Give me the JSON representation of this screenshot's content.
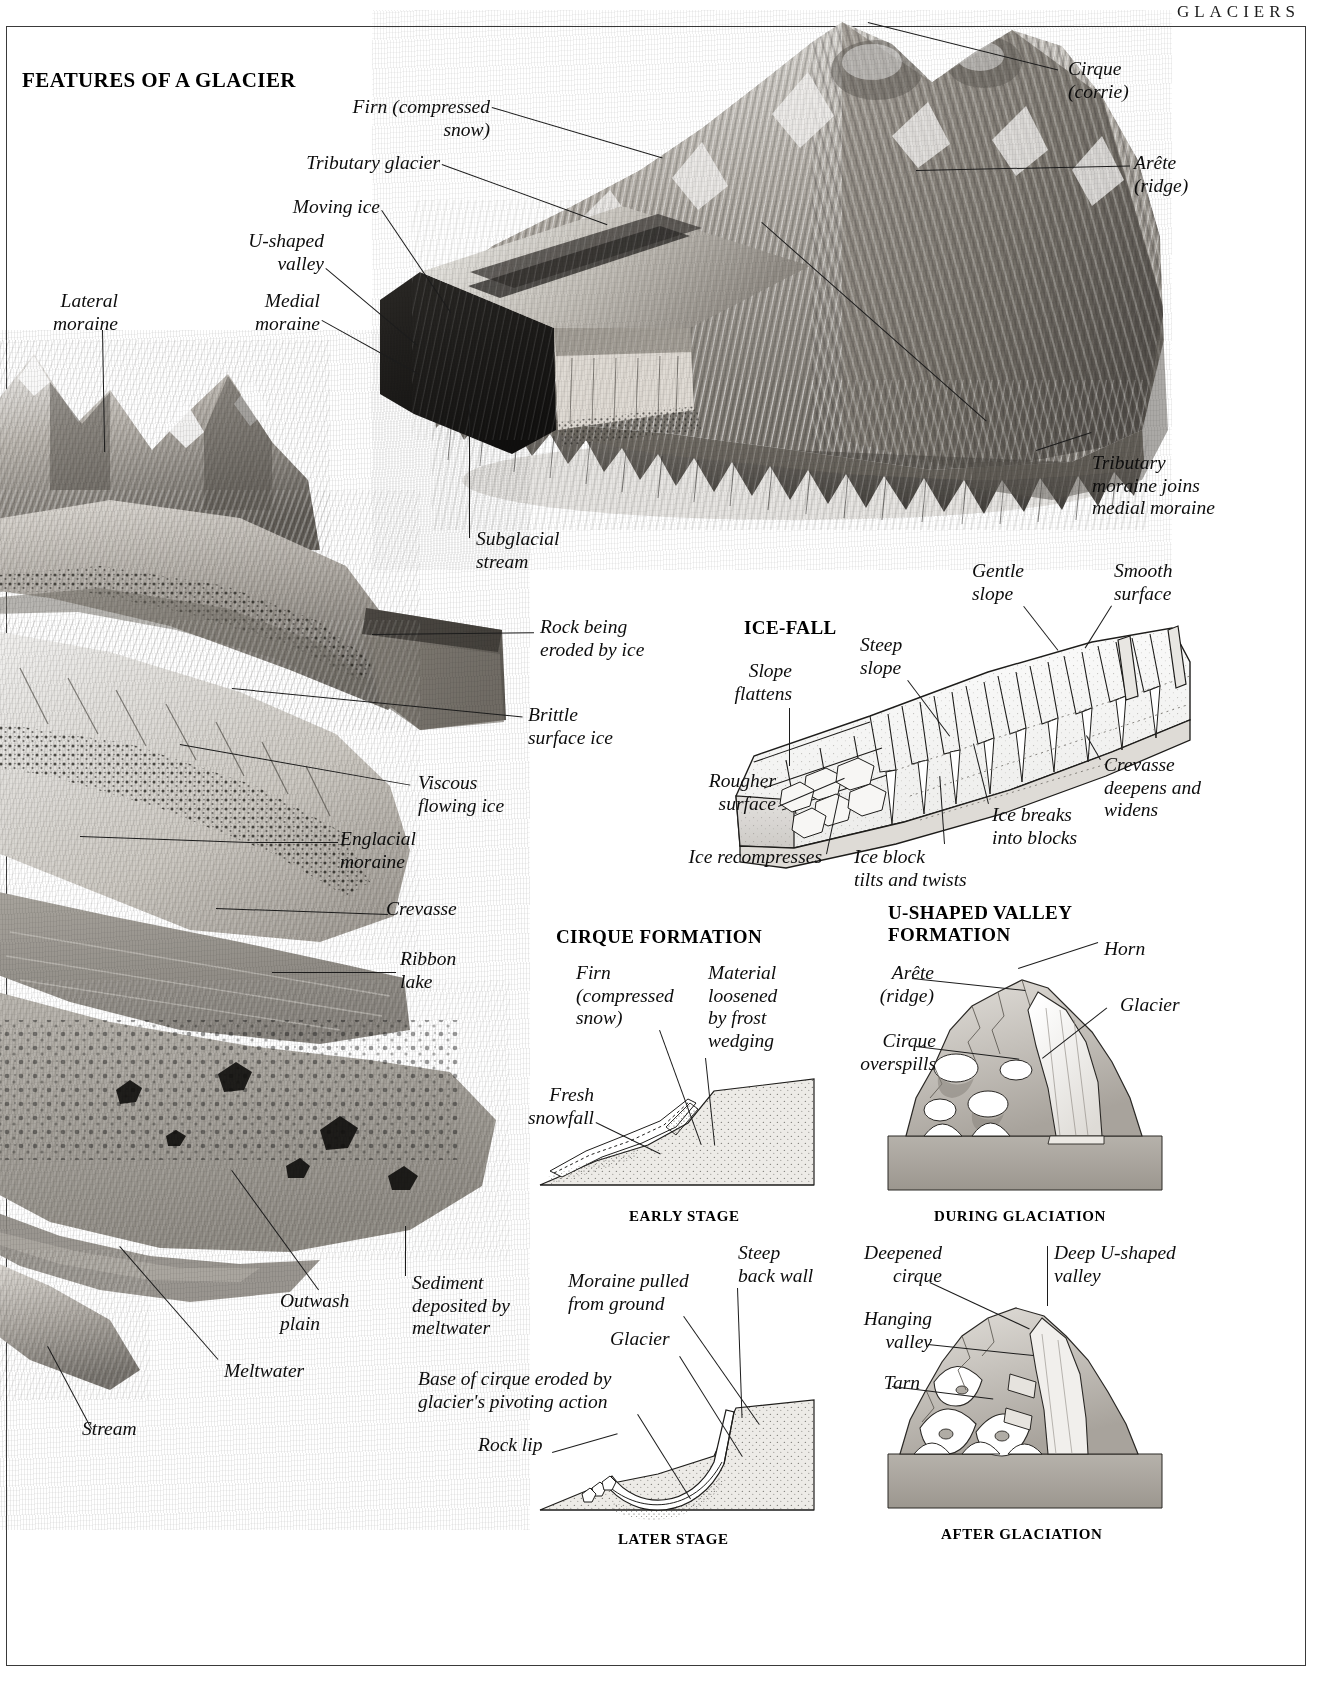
{
  "page": {
    "running_head": "GLACIERS"
  },
  "sections": {
    "features": {
      "title": "FEATURES OF A GLACIER"
    },
    "icefall": {
      "title": "ICE-FALL"
    },
    "cirque_formation": {
      "title": "CIRQUE FORMATION"
    },
    "ushaped_valley_formation": {
      "title": "U-SHAPED VALLEY\nFORMATION"
    }
  },
  "stage_captions": {
    "early": "EARLY STAGE",
    "later": "LATER  STAGE",
    "during": "DURING GLACIATION",
    "after": "AFTER GLACIATION"
  },
  "features_labels": {
    "firn": "Firn (compressed\nsnow)",
    "tributary_glacier": "Tributary glacier",
    "moving_ice": "Moving ice",
    "u_shaped_valley": "U-shaped\nvalley",
    "medial_moraine": "Medial\nmoraine",
    "lateral_moraine": "Lateral\nmoraine",
    "cirque": "Cirque\n(corrie)",
    "arete": "Arête\n(ridge)",
    "tributary_moraine": "Tributary\nmoraine joins\nmedial moraine",
    "subglacial_stream": "Subglacial\nstream",
    "rock_eroded": "Rock being\neroded by ice",
    "brittle_surface_ice": "Brittle\nsurface ice",
    "viscous_flowing_ice": "Viscous\nflowing ice",
    "englacial_moraine": "Englacial\nmoraine",
    "crevasse": "Crevasse",
    "ribbon_lake": "Ribbon\nlake",
    "sediment_meltwater": "Sediment\ndeposited by\nmeltwater",
    "outwash_plain": "Outwash\nplain",
    "meltwater": "Meltwater",
    "stream": "Stream"
  },
  "icefall_labels": {
    "gentle_slope": "Gentle\nslope",
    "smooth_surface": "Smooth\nsurface",
    "steep_slope": "Steep\nslope",
    "slope_flattens": "Slope\nflattens",
    "rougher_surface": "Rougher\nsurface",
    "crevasse_deepens": "Crevasse\ndeepens and\nwidens",
    "ice_breaks": "Ice breaks\ninto blocks",
    "ice_block_tilts": "Ice block\ntilts and twists",
    "ice_recompresses": "Ice recompresses"
  },
  "cirque_labels": {
    "firn": "Firn\n(compressed\nsnow)",
    "material_loosened": "Material\nloosened\nby frost\nwedging",
    "fresh_snowfall": "Fresh\nsnowfall",
    "moraine_pulled": "Moraine pulled\nfrom ground",
    "steep_back_wall": "Steep\nback wall",
    "glacier": "Glacier",
    "base_of_cirque": "Base of cirque eroded by\nglacier's pivoting action",
    "rock_lip": "Rock lip"
  },
  "ushaped_labels": {
    "horn": "Horn",
    "arete": "Arête\n(ridge)",
    "glacier": "Glacier",
    "cirque_overspills": "Cirque\noverspills",
    "deepened_cirque": "Deepened\ncirque",
    "deep_u_shaped_valley": "Deep U-shaped\nvalley",
    "hanging_valley": "Hanging\nvalley",
    "tarn": "Tarn"
  },
  "colors": {
    "ink": "#111111",
    "leader": "#1c1c1c",
    "rock_light": "#d8d5d0",
    "rock_mid": "#a9a49d",
    "rock_dark": "#6c6862",
    "ice_light": "#f2f1ef",
    "ground": "#bfbcb6",
    "moraine_dark": "#3b3936"
  }
}
